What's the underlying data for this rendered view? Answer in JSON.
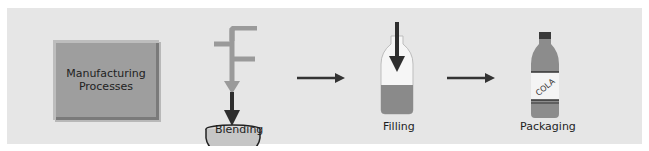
{
  "diagram": {
    "start_box": {
      "line1": "Manufacturing",
      "line2": "Processes"
    },
    "steps": [
      {
        "label": "Blending",
        "icon": "pipe-into-bowl-icon"
      },
      {
        "label": "Filling",
        "icon": "bottle-filling-icon"
      },
      {
        "label": "Packaging",
        "icon": "cola-bottle-icon",
        "bottle_label": "COLA"
      }
    ],
    "colors": {
      "panel_bg": "#e6e6e6",
      "box_fill": "#9e9e9e",
      "pipe": "#9a9a9a",
      "arrow": "#333333",
      "liquid": "#8a8a8a"
    }
  }
}
